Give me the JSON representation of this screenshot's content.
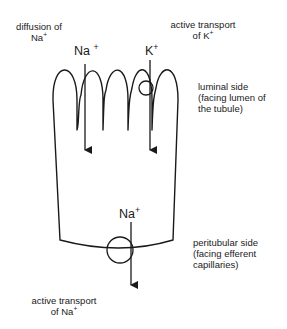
{
  "labels": {
    "diffusion_na_line1": "diffusion  of",
    "diffusion_na_line2_base": "Na",
    "diffusion_na_line2_sup": "+",
    "active_k_line1": "active  transport",
    "active_k_line2_base": "of  K",
    "active_k_line2_sup": "+",
    "luminal_line1": "luminal  side",
    "luminal_line2": "(facing  lumen  of",
    "luminal_line3": "the  tubule)",
    "peritubular_line1": "peritubular  side",
    "peritubular_line2": "(facing  efferent",
    "peritubular_line3": "capillaries)",
    "active_na_line1": "active  transport",
    "active_na_line2_base": "of  Na",
    "active_na_line2_sup": "+"
  },
  "ions": {
    "top_na_base": "Na",
    "top_na_sup": "+",
    "top_k_base": "K",
    "top_k_sup": "+",
    "bottom_na_base": "Na",
    "bottom_na_sup": "+"
  },
  "colors": {
    "stroke": "#1a1a1a",
    "background": "#ffffff"
  }
}
